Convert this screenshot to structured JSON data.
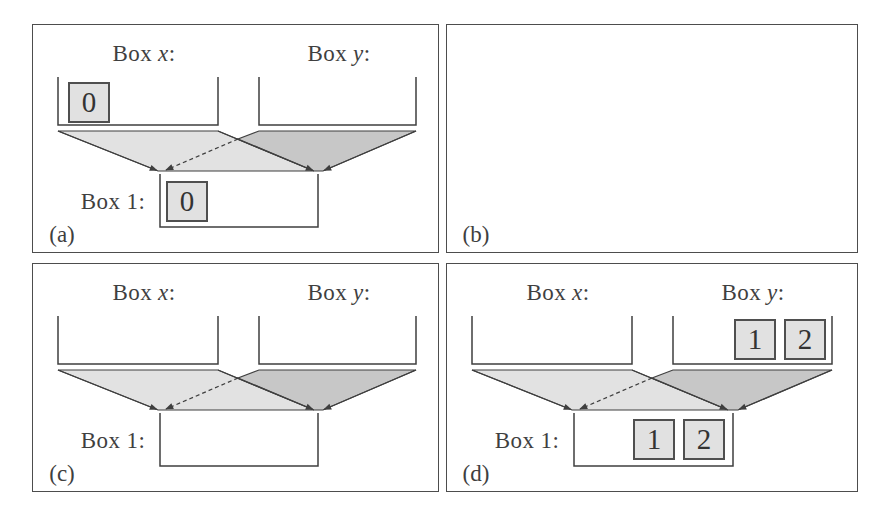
{
  "colors": {
    "ink": "#3f3f3f",
    "funnel_light": "#e2e2e2",
    "funnel_dark": "#c7c7c7",
    "token_fill": "#e1e1e1",
    "token_border": "#4f4f4f",
    "panel_border": "#4d4d4d",
    "background": "#ffffff"
  },
  "panels": [
    {
      "letter": "(a)",
      "box_x": {
        "word": "Box",
        "variable": "x",
        "punct": ":",
        "tokens": [
          "0"
        ]
      },
      "box_y": {
        "word": "Box",
        "variable": "y",
        "punct": ":",
        "tokens": []
      },
      "box_1": {
        "label": "Box 1:",
        "tokens": [
          "0"
        ]
      }
    },
    {
      "letter": "(b)"
    },
    {
      "letter": "(c)",
      "box_x": {
        "word": "Box",
        "variable": "x",
        "punct": ":",
        "tokens": []
      },
      "box_y": {
        "word": "Box",
        "variable": "y",
        "punct": ":",
        "tokens": []
      },
      "box_1": {
        "label": "Box 1:",
        "tokens": []
      }
    },
    {
      "letter": "(d)",
      "box_x": {
        "word": "Box",
        "variable": "x",
        "punct": ":",
        "tokens": []
      },
      "box_y": {
        "word": "Box",
        "variable": "y",
        "punct": ":",
        "tokens": [
          "1",
          "2"
        ]
      },
      "box_1": {
        "label": "Box 1:",
        "tokens": [
          "1",
          "2"
        ]
      }
    }
  ]
}
